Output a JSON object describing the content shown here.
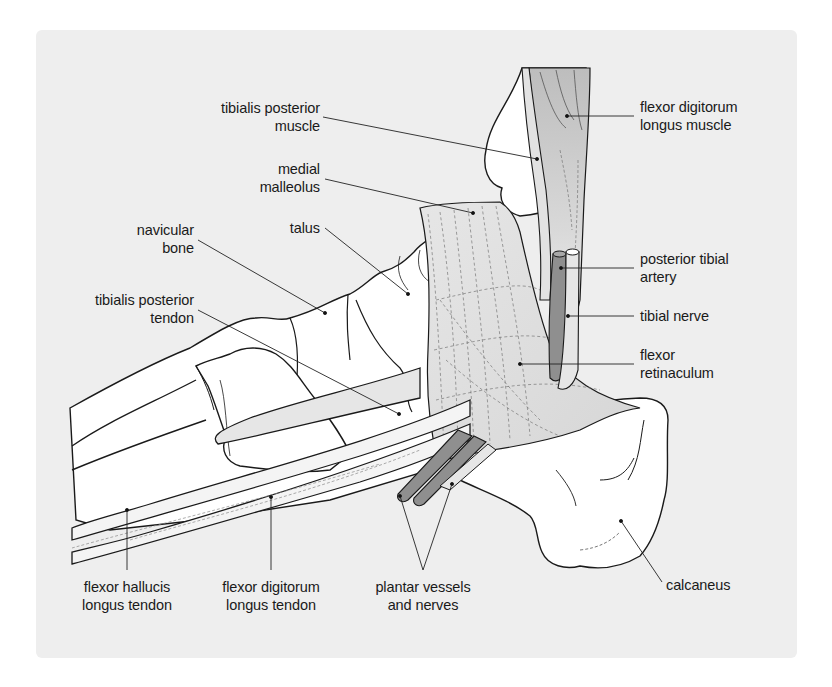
{
  "figure": {
    "type": "anatomical illustration",
    "colors": {
      "panel_background": "#eeeeee",
      "bone": "#ffffff",
      "outline": "#1a1a1a",
      "retinaculum": "#dcdcdc",
      "muscle_shade": "#c8c8c8",
      "artery": "#8f8f8f",
      "nerve": "#e4e4e4",
      "leader_line": "#222222"
    }
  },
  "labels": {
    "tibialis_posterior_muscle": "tibialis posterior\nmuscle",
    "medial_malleolus": "medial\nmalleolus",
    "talus": "talus",
    "navicular_bone": "navicular\nbone",
    "tibialis_posterior_tendon": "tibialis posterior\ntendon",
    "flexor_digitorum_longus_muscle": "flexor digitorum\nlongus muscle",
    "posterior_tibial_artery": "posterior tibial\nartery",
    "tibial_nerve": "tibial nerve",
    "flexor_retinaculum": "flexor\nretinaculum",
    "flexor_hallucis_longus_tendon": "flexor hallucis\nlongus tendon",
    "flexor_digitorum_longus_tendon": "flexor digitorum\nlongus tendon",
    "plantar_vessels_and_nerves": "plantar vessels\nand nerves",
    "calcaneus": "calcaneus"
  }
}
